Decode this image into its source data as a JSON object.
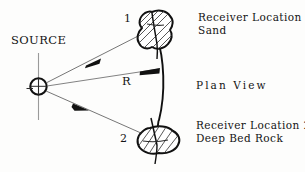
{
  "figure": {
    "type": "seismic-refraction-plan-view-diagram",
    "background_color": "#fdfdfc",
    "ink_color": "#141414",
    "labels": {
      "source": "SOURCE",
      "distance": "R",
      "ray_number_1": "1",
      "ray_number_2": "2",
      "receiver_1_title": "Receiver Location 1",
      "receiver_1_material": "Sand",
      "plan_view": "Plan View",
      "receiver_2_title": "Receiver Location 2",
      "receiver_2_material": "Deep Bed Rock"
    },
    "elements": {
      "source_symbol": "circle-with-vertical-axis-line",
      "receiver_1_symbol": "hatched-irregular-blob",
      "receiver_2_symbol": "hatched-irregular-blob",
      "radius_arc": "arc-of-constant-radius-R",
      "ray_1": "arrow-from-source-to-receiver-1",
      "ray_2": "arrow-from-source-to-receiver-2",
      "ray_r": "arrow-from-source-along-radius-R"
    }
  }
}
